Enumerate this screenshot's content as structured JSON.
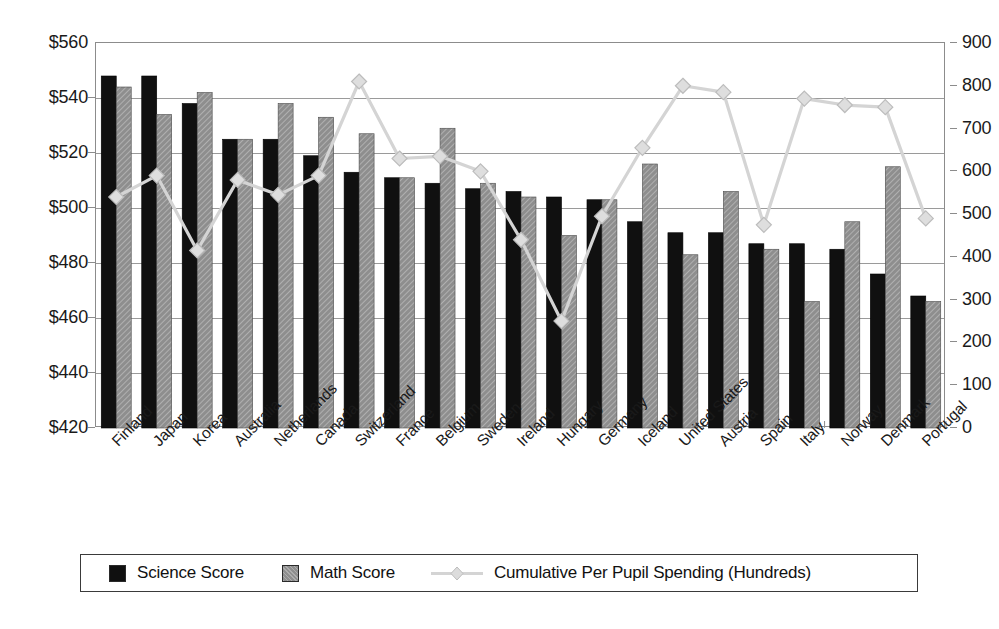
{
  "chart_data": {
    "type": "bar",
    "title": "",
    "subtitle": "",
    "xlabel": "",
    "ylabel": "",
    "ylabel_right": "",
    "grid": true,
    "legend_position": "bottom",
    "ylim": [
      420,
      560
    ],
    "ylim_right": [
      0,
      900
    ],
    "ytick_labels": [
      "$560",
      "$540",
      "$520",
      "$500",
      "$480",
      "$460",
      "$440",
      "$420"
    ],
    "ytick_values": [
      560,
      540,
      520,
      500,
      480,
      460,
      440,
      420
    ],
    "ytick_labels_right": [
      "900",
      "800",
      "700",
      "600",
      "500",
      "400",
      "300",
      "200",
      "100",
      "0"
    ],
    "ytick_values_right": [
      900,
      800,
      700,
      600,
      500,
      400,
      300,
      200,
      100,
      0
    ],
    "categories": [
      "Finland",
      "Japan",
      "Korea",
      "Australia",
      "Netherlands",
      "Canada",
      "Switzerland",
      "France",
      "Belgium",
      "Sweden",
      "Ireland",
      "Hungary",
      "Germany",
      "Iceland",
      "United States",
      "Austria",
      "Spain",
      "Italy",
      "Norway",
      "Denmark",
      "Portugal"
    ],
    "series": [
      {
        "name": "Science Score",
        "axis": "left",
        "type": "bar",
        "color": "#101010",
        "values": [
          548,
          548,
          538,
          525,
          525,
          519,
          513,
          511,
          509,
          507,
          506,
          504,
          503,
          495,
          491,
          491,
          487,
          487,
          485,
          476,
          468
        ]
      },
      {
        "name": "Math Score",
        "axis": "left",
        "type": "bar",
        "color": "#8e8e8e",
        "values": [
          544,
          534,
          542,
          525,
          538,
          533,
          527,
          511,
          529,
          509,
          504,
          490,
          503,
          516,
          483,
          506,
          485,
          466,
          495,
          515,
          466
        ]
      },
      {
        "name": "Cumulative Per Pupil Spending (Hundreds)",
        "axis": "right",
        "type": "line",
        "color": "#d4d4d4",
        "marker": "diamond",
        "values": [
          540,
          590,
          415,
          580,
          545,
          590,
          810,
          630,
          635,
          600,
          440,
          250,
          495,
          655,
          800,
          785,
          475,
          770,
          755,
          750,
          490
        ]
      }
    ],
    "legend": [
      {
        "label": "Science Score",
        "swatch": "black-square"
      },
      {
        "label": "Math Score",
        "swatch": "gray-square"
      },
      {
        "label": "Cumulative Per Pupil Spending (Hundreds)",
        "swatch": "gray-line-diamond"
      }
    ],
    "colors": {
      "science": "#101010",
      "math": "#8e8e8e",
      "spending_line": "#d4d4d4",
      "grid": "#9a9a9a",
      "frame": "#8c8c8c",
      "text": "#1a1a1a"
    }
  }
}
